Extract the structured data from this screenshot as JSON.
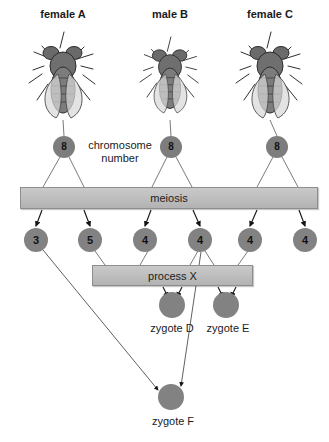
{
  "diagram": {
    "background_color": "#ffffff",
    "node_color": "#7f7f7f",
    "bar_color": "#bdbdbd",
    "arrow_color": "#1a1a1a"
  },
  "parents": [
    {
      "label": "female A",
      "icon": "fruit-fly-icon",
      "cx": 63
    },
    {
      "label": "male B",
      "icon": "fruit-fly-icon",
      "cx": 170
    },
    {
      "label": "female C",
      "icon": "fruit-fly-icon",
      "cx": 270
    }
  ],
  "chromosome_number_label": "chromosome number",
  "chromosome_nodes": [
    {
      "value": "8",
      "cx": 64,
      "cy": 147
    },
    {
      "value": "8",
      "cx": 171,
      "cy": 147
    },
    {
      "value": "8",
      "cx": 277,
      "cy": 147
    }
  ],
  "meiosis_bar": {
    "label": "meiosis",
    "x": 20,
    "y": 187,
    "width": 298,
    "height": 22
  },
  "gametes": [
    {
      "value": "3",
      "cx": 36,
      "cy": 240
    },
    {
      "value": "5",
      "cx": 90,
      "cy": 240
    },
    {
      "value": "4",
      "cx": 145,
      "cy": 240
    },
    {
      "value": "4",
      "cx": 200,
      "cy": 240
    },
    {
      "value": "4",
      "cx": 250,
      "cy": 240
    },
    {
      "value": "4",
      "cx": 305,
      "cy": 240
    }
  ],
  "process_bar": {
    "label": "process X",
    "x": 92,
    "y": 265,
    "width": 161,
    "height": 21
  },
  "zygotes": [
    {
      "label": "zygote D",
      "cx": 172,
      "cy": 305
    },
    {
      "label": "zygote E",
      "cx": 226,
      "cy": 305
    },
    {
      "label": "zygote F",
      "cx": 171,
      "cy": 397
    }
  ]
}
